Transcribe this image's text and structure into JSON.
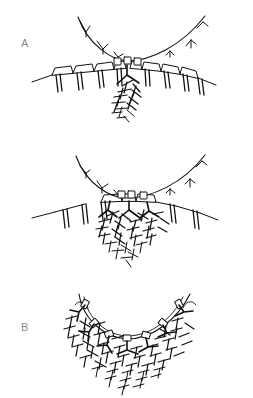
{
  "figure": {
    "background_color": "#ffffff",
    "ink_color": "#111111",
    "label_color": "#8a8a8a",
    "width": 253,
    "height": 398
  },
  "panels": [
    {
      "id": "A",
      "label": "A",
      "caption": "Stage A: sparse terminal complexes on the arc, few nascent fibrils",
      "arc": "outer membrane arc with inward Y-shaped tick marks",
      "band": "row of trapezoidal segments with paired vertical prongs",
      "fibril_density": "low",
      "rosette_count": 3,
      "tick_count": 6
    },
    {
      "id": "B",
      "label": "B",
      "caption": "Stage B: clustered terminal complexes, moderate fibril mesh",
      "arc": "outer membrane arc with inward Y-shaped tick marks",
      "band": "interrupted row of trapezoidal segments with paired vertical prongs",
      "fibril_density": "medium",
      "rosette_count": 3,
      "tick_count": 6
    },
    {
      "id": "C",
      "label": "C",
      "caption": "Stage C: continuous rosette array along the arc, dense fibril mesh",
      "arc": "double-walled membrane arc lined with rosette units",
      "band": "rosettes seated directly on the arc with splayed stems",
      "fibril_density": "high",
      "rosette_count": 7,
      "tick_count": 0
    }
  ],
  "legend_keys": {
    "arc": "membrane-arc",
    "rosette": "terminal-complex-rosette",
    "prong": "vesicle-prong",
    "fibril": "microfibril"
  },
  "icons": {
    "panel_marker": "letter-label"
  }
}
